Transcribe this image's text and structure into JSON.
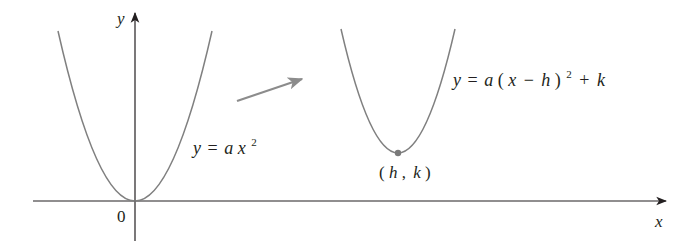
{
  "figure": {
    "axes": {
      "x_label": "x",
      "y_label": "y",
      "origin_label": "0"
    },
    "curves": [
      {
        "name": "base-parabola",
        "equation_label": {
          "lhs": "y",
          "eq": "=",
          "rhs_a": "a",
          "rhs_x": "x",
          "exponent": "2"
        },
        "vertex": [
          0,
          0
        ]
      },
      {
        "name": "shifted-parabola",
        "equation_label": {
          "lhs": "y",
          "eq": "=",
          "a": "a",
          "open": "(",
          "x": "x",
          "minus": "−",
          "h": "h",
          "close": ")",
          "exponent": "2",
          "plus": "+",
          "k": "k"
        },
        "vertex_label": {
          "open": "(",
          "h": "h",
          "comma": ",",
          "k": "k",
          "close": ")"
        }
      }
    ],
    "colors": {
      "axis": "#231f20",
      "curve": "#808080",
      "arrow": "#8c8c8c",
      "vertex_dot": "#7a7a7a",
      "text": "#231f20"
    }
  }
}
